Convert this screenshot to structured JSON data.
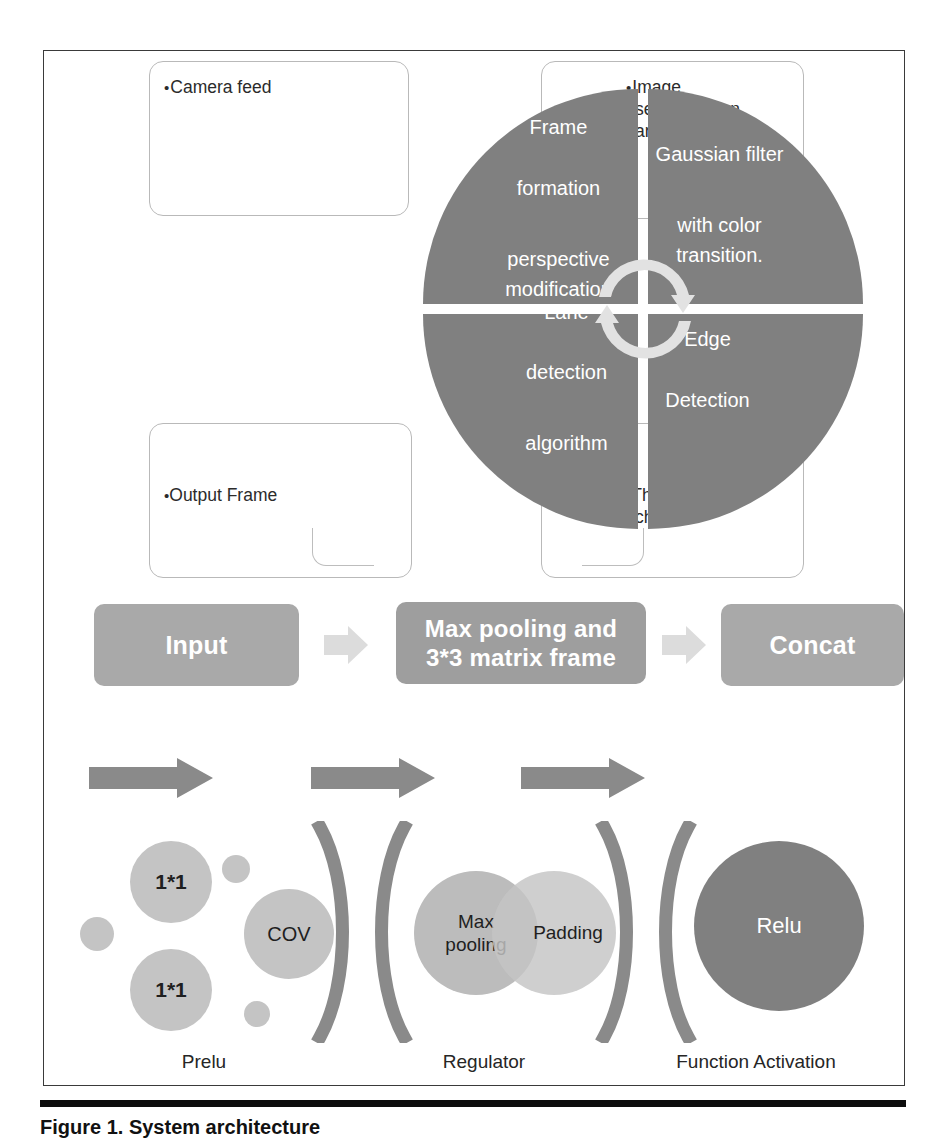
{
  "figure": {
    "caption": "Figure 1. System architecture"
  },
  "colors": {
    "pie_gray": "#808080",
    "box_gray": "#a9a9a9",
    "circle_light": "#c4c4c4",
    "circle_dark": "#808080",
    "callout_border": "#b9b9b9",
    "frame_border": "#3a3a3a",
    "caption_rule": "#0d0d0d"
  },
  "callouts": [
    {
      "id": "camera-feed",
      "lines": [
        "Camera feed"
      ]
    },
    {
      "id": "image-seg",
      "lines": [
        "Image",
        "segmentation",
        "and filters"
      ]
    },
    {
      "id": "output-frame",
      "lines": [
        "Output Frame"
      ]
    },
    {
      "id": "threshold",
      "lines": [
        "Threshold",
        "check"
      ]
    }
  ],
  "wheel": {
    "quadrants": [
      {
        "id": "top-left",
        "lines": [
          "Frame",
          "formation",
          "perspective",
          "modification"
        ]
      },
      {
        "id": "top-right",
        "lines": [
          "Gaussian filter",
          "with color",
          "transition."
        ]
      },
      {
        "id": "bottom-left",
        "lines": [
          "Lane",
          "detection",
          "algorithm"
        ]
      },
      {
        "id": "bottom-right",
        "lines": [
          "Edge",
          "Detection"
        ]
      }
    ],
    "center_icon": "cycle-arrows-icon"
  },
  "pipeline": {
    "steps": [
      {
        "id": "input",
        "lines": [
          "Input"
        ]
      },
      {
        "id": "maxpool",
        "lines": [
          "Max pooling and",
          "3*3 matrix frame"
        ]
      },
      {
        "id": "concat",
        "lines": [
          "Concat"
        ]
      }
    ],
    "connector_icon": "chevron-arrow-icon"
  },
  "blocks": {
    "arrows": [
      "block-arrow-1",
      "block-arrow-2",
      "block-arrow-3"
    ],
    "groups": [
      {
        "id": "prelu",
        "label": "Prelu",
        "nodes": [
          {
            "id": "one-by-one-top",
            "text": "1*1"
          },
          {
            "id": "one-by-one-bottom",
            "text": "1*1"
          },
          {
            "id": "cov",
            "text": "COV"
          },
          {
            "id": "dot-left",
            "text": ""
          },
          {
            "id": "dot-upper",
            "text": ""
          },
          {
            "id": "dot-lower",
            "text": ""
          }
        ]
      },
      {
        "id": "regulator",
        "label": "Regulator",
        "nodes": [
          {
            "id": "max-pooling",
            "text": "Max\npooling"
          },
          {
            "id": "padding",
            "text": "Padding"
          }
        ]
      },
      {
        "id": "function-activation",
        "label": "Function Activation",
        "nodes": [
          {
            "id": "relu",
            "text": "Relu"
          }
        ]
      }
    ]
  },
  "labels": {
    "maxpool_line1": "Max",
    "maxpool_line2": "pooling",
    "padding": "Padding",
    "relu": "Relu",
    "cov": "COV",
    "one_one": "1*1",
    "prelu": "Prelu",
    "regulator": "Regulator",
    "function_activation": "Function Activation"
  }
}
